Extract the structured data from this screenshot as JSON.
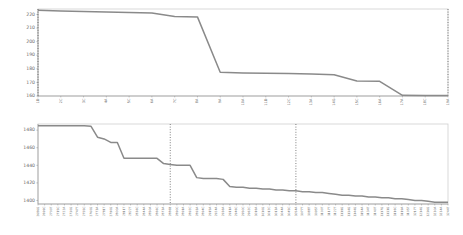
{
  "page": {
    "background_color": "#ffffff",
    "line_color": "#8a8a8a",
    "frame_color": "#cfcfcf",
    "refline_color": "#4a4a4a",
    "text_color": "#6b6b6b"
  },
  "chart_data": [
    {
      "id": "top-chart",
      "type": "line",
      "title": "",
      "subtitle": "",
      "xlabel": "",
      "ylabel": "",
      "grid": false,
      "legend": false,
      "ylim": [
        160,
        224
      ],
      "yticks": [
        160,
        170,
        180,
        190,
        200,
        210,
        220
      ],
      "ytick_labels": [
        "160",
        "170",
        "180",
        "190",
        "200",
        "210",
        "220"
      ],
      "categories": [
        "1D",
        "2C",
        "3C",
        "4A",
        "5C",
        "6A",
        "7C",
        "8A",
        "9A",
        "10A",
        "11D",
        "12C",
        "13A",
        "14G",
        "15C",
        "16A",
        "17A",
        "18C",
        "19A"
      ],
      "values": [
        223,
        222.6,
        222.2,
        221.8,
        221.4,
        221.0,
        218.5,
        218.2,
        177.5,
        177.0,
        176.8,
        176.5,
        176.2,
        175.6,
        171.0,
        170.8,
        160.5,
        160.4,
        160.3
      ],
      "reference_lines": [
        {
          "category": "1D",
          "index": 0
        },
        {
          "category": "19A",
          "index": 18
        }
      ]
    },
    {
      "id": "bottom-chart",
      "type": "line",
      "title": "",
      "subtitle": "",
      "xlabel": "",
      "ylabel": "",
      "grid": false,
      "legend": false,
      "ylim": [
        1396,
        1487
      ],
      "yticks": [
        1400,
        1420,
        1440,
        1460,
        1480
      ],
      "ytick_labels": [
        "1400",
        "1420",
        "1440",
        "1460",
        "1480"
      ],
      "categories": [
        "2686G",
        "2699C",
        "2700T",
        "2715C",
        "2722A",
        "2730G",
        "2747T",
        "2755C",
        "2760G",
        "2773A",
        "2781T",
        "2790G",
        "2800A",
        "2811T",
        "2822T",
        "2836C",
        "2844A",
        "2850A",
        "2866C",
        "2873A",
        "2886B",
        "2890C",
        "2891A",
        "2892C",
        "2893A",
        "2894C",
        "2915A",
        "2924A",
        "2936A",
        "2911A",
        "2946C",
        "2950C",
        "2962C",
        "3016A",
        "3010G",
        "3012C",
        "3013A",
        "3044A",
        "3045C",
        "3054A",
        "3077T",
        "3088T",
        "3095T",
        "3100T",
        "3117T",
        "3122T",
        "3119G",
        "3134G",
        "3144G",
        "3154A",
        "3134T",
        "3140T",
        "3117G",
        "3131G",
        "3116C",
        "3119A",
        "3105T",
        "3217T",
        "3214G",
        "3236G",
        "3230A",
        "3234A",
        "3244T"
      ],
      "values": [
        1485,
        1485,
        1485,
        1485,
        1485,
        1485,
        1485,
        1485,
        1484.5,
        1472,
        1470,
        1466,
        1466,
        1448,
        1448,
        1448,
        1448,
        1448,
        1448,
        1442,
        1441,
        1440,
        1440,
        1440,
        1426,
        1425,
        1425,
        1425,
        1424,
        1416,
        1415,
        1415,
        1414,
        1414,
        1413,
        1413,
        1412,
        1412,
        1411,
        1411,
        1410,
        1410,
        1409,
        1409,
        1408,
        1407,
        1406,
        1406,
        1405,
        1405,
        1404,
        1404,
        1403,
        1403,
        1402,
        1402,
        1401,
        1400,
        1400,
        1399,
        1398,
        1398,
        1398
      ],
      "reference_lines": [
        {
          "category": "2886B",
          "index": 20
        },
        {
          "category": "3054A",
          "index": 39
        }
      ]
    }
  ]
}
